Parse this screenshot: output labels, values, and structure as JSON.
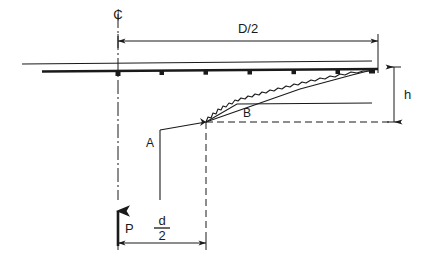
{
  "diagram": {
    "type": "engineering-cross-section",
    "background_color": "#ffffff",
    "line_color": "#1a1a1a",
    "labels": {
      "centerline": "₵",
      "half_diameter": "D/2",
      "height": "h",
      "load": "P",
      "point_a": "A",
      "point_b": "B",
      "half_depth_numerator": "d",
      "half_depth_denominator": "2",
      "half_depth_plain": "d/2"
    },
    "geometry": {
      "centerline_x": 118,
      "top_thin_line_y": 63,
      "top_thick_line_y": 71,
      "thick_line_start_x": 42,
      "thick_line_end_x": 378,
      "thin_line_start_x": 22,
      "thin_line_end_x": 372,
      "node_marker_count": 6,
      "node_marker_xs": [
        118,
        162,
        206,
        250,
        294,
        338
      ],
      "node_marker_y": 71,
      "junction_x": 206,
      "junction_y": 122,
      "point_a_x": 160,
      "point_a_y": 130,
      "vertical_stub_bottom_y": 200,
      "b_shelf_y": 104,
      "b_shelf_start_x": 206,
      "b_shelf_end_x": 372,
      "dim_d2_y": 243,
      "dim_D2_y": 41,
      "dim_h_x": 394,
      "h_top_y": 67,
      "h_bottom_y": 122,
      "load_arrow_x": 118,
      "load_arrow_tail_y": 246,
      "load_arrow_head_y": 205
    },
    "elements": [
      {
        "name": "centerline-axis",
        "style": "dash-dot",
        "orientation": "vertical"
      },
      {
        "name": "upper-thin-surface-line",
        "style": "solid-thin",
        "orientation": "horizontal"
      },
      {
        "name": "lower-thick-plate-line",
        "style": "solid-thick",
        "orientation": "horizontal"
      },
      {
        "name": "node-markers",
        "style": "filled-square",
        "count": 6
      },
      {
        "name": "deflection-straight-line",
        "style": "solid-thin",
        "orientation": "inclined"
      },
      {
        "name": "deflection-jagged-curve",
        "style": "zigzag",
        "orientation": "inclined"
      },
      {
        "name": "b-shelf-line",
        "style": "solid-thin",
        "orientation": "horizontal"
      },
      {
        "name": "b-dashed-datum",
        "style": "dashed",
        "orientation": "horizontal"
      },
      {
        "name": "junction-dashed-vertical",
        "style": "dashed",
        "orientation": "vertical"
      },
      {
        "name": "vertical-stub-below-a",
        "style": "solid-thin",
        "orientation": "vertical"
      },
      {
        "name": "load-arrow",
        "style": "thick-arrow-up"
      },
      {
        "name": "dimension-D-over-2",
        "style": "dimension-line"
      },
      {
        "name": "dimension-d-over-2",
        "style": "dimension-line"
      },
      {
        "name": "dimension-h",
        "style": "dimension-line"
      }
    ]
  }
}
